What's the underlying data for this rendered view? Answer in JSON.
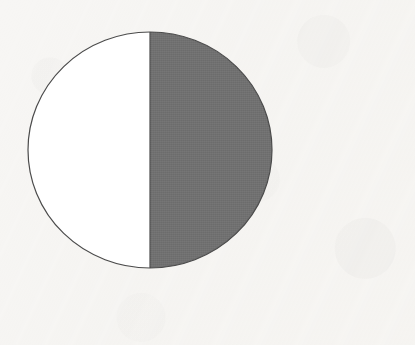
{
  "figure": {
    "title": "Circle divided into two equal halves, one half shaded",
    "shape": "circle",
    "background_color": "#f7f6f4",
    "outline_color": "#4b4b4b",
    "outline_width_px": 1.2,
    "center": {
      "x": 150,
      "y": 150
    },
    "radius": {
      "x": 122,
      "y": 118
    },
    "bounds": {
      "left": 28,
      "top": 32,
      "right": 272,
      "bottom": 268
    },
    "divider": {
      "orientation": "vertical",
      "x": 150,
      "y_top": 32,
      "y_bottom": 268,
      "color": "#4b4b4b"
    },
    "parts": [
      {
        "name": "left-half",
        "position": "left",
        "fill_color": "#ffffff",
        "state": "unshaded",
        "fraction": "1/2",
        "fraction_decimal": 0.5,
        "percent": 50,
        "angle_degrees": 180
      },
      {
        "name": "right-half",
        "position": "right",
        "fill_color": "#6f6f6f",
        "state": "shaded",
        "fraction": "1/2",
        "fraction_decimal": 0.5,
        "percent": 50,
        "angle_degrees": 180
      }
    ],
    "total_parts": 2,
    "shaded_parts": 1,
    "shaded_fraction": "1/2"
  },
  "labels": {
    "caption": "",
    "annotations": []
  }
}
